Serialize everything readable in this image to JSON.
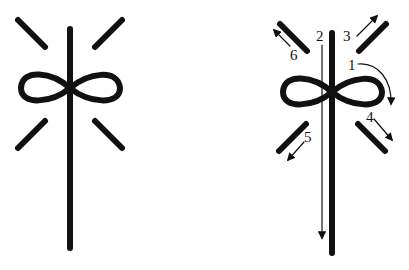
{
  "diagram": {
    "left_figure": {
      "name": "symbol-plain"
    },
    "right_figure": {
      "name": "symbol-stroke-order",
      "labels": [
        "1",
        "2",
        "3",
        "4",
        "5",
        "6"
      ]
    },
    "stroke_color": "#111111",
    "background_color": "#ffffff"
  }
}
